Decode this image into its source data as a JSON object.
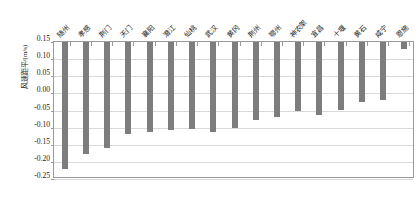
{
  "chart_data": {
    "type": "bar",
    "title": "",
    "xlabel": "",
    "ylabel": "风速距平/(m/s)",
    "ylim": [
      -0.25,
      0.15
    ],
    "yticks": [
      0.15,
      0.1,
      0.05,
      0.0,
      -0.05,
      -0.1,
      -0.15,
      -0.2,
      -0.25
    ],
    "ytick_labels": [
      "0.15",
      "0.10",
      "0.05",
      "0.00",
      "-0.05",
      "-0.10",
      "-0.15",
      "-0.20",
      "-0.25"
    ],
    "grid": true,
    "legend": "none",
    "bar_color": "#7d7d7d",
    "categories": [
      "随州",
      "孝感",
      "荆门",
      "天门",
      "襄阳",
      "潜江",
      "仙桃",
      "武汉",
      "黄冈",
      "荆州",
      "鄂州",
      "神农架",
      "宜昌",
      "十堰",
      "黄石",
      "咸宁",
      "恩施"
    ],
    "values": [
      -0.222,
      -0.178,
      -0.16,
      -0.118,
      -0.113,
      -0.107,
      -0.105,
      -0.113,
      -0.1,
      -0.078,
      -0.07,
      -0.05,
      -0.062,
      -0.048,
      -0.025,
      -0.02,
      0.13
    ]
  }
}
